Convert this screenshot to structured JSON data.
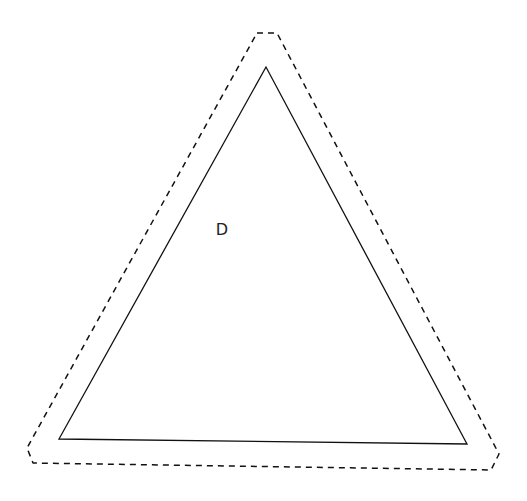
{
  "diagram": {
    "background": "#ffffff",
    "stroke_color": "#111111",
    "inner_triangle": {
      "points": "266,67 59,439 467,444",
      "stroke_width": 1.3
    },
    "outer_outline": {
      "points": "257,33 277,33 499,454 491,470 33,463 27,448",
      "stroke_width": 1.5,
      "dash": "6,5"
    },
    "label": {
      "text": "D",
      "x": 222,
      "y": 235
    }
  }
}
